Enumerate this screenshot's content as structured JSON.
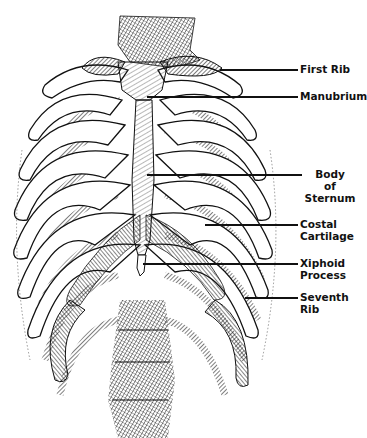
{
  "figure": {
    "labels": [
      {
        "id": "first-rib",
        "text": "First Rib",
        "lines": [
          "First Rib"
        ],
        "line_y": 70,
        "line_x1": 220,
        "line_x2": 298,
        "text_x": 300,
        "text_y": 64,
        "align": "left"
      },
      {
        "id": "manubrium",
        "text": "Manubrium",
        "lines": [
          "Manubrium"
        ],
        "line_y": 97,
        "line_x1": 147,
        "line_x2": 298,
        "text_x": 300,
        "text_y": 91,
        "align": "left"
      },
      {
        "id": "body-of-sternum",
        "text": "Body of Sternum",
        "lines": [
          "Body",
          "of",
          "Sternum"
        ],
        "line_y": 175,
        "line_x1": 147,
        "line_x2": 302,
        "text_x": 303,
        "text_y": 169,
        "align": "center"
      },
      {
        "id": "costal-cartilage",
        "text": "Costal Cartilage",
        "lines": [
          "Costal",
          "Cartilage"
        ],
        "line_y": 225,
        "line_x1": 205,
        "line_x2": 298,
        "text_x": 300,
        "text_y": 219,
        "align": "left"
      },
      {
        "id": "xiphoid-process",
        "text": "Xiphoid Process",
        "lines": [
          "Xiphoid",
          "Process"
        ],
        "line_y": 264,
        "line_x1": 143,
        "line_x2": 298,
        "text_x": 300,
        "text_y": 258,
        "align": "left"
      },
      {
        "id": "seventh-rib",
        "text": "Seventh Rib",
        "lines": [
          "Seventh",
          "Rib"
        ],
        "line_y": 298,
        "line_x1": 245,
        "line_x2": 298,
        "text_x": 300,
        "text_y": 292,
        "align": "left"
      }
    ]
  },
  "colors": {
    "ink": "#111111",
    "background": "#ffffff",
    "bone_fill": "#ffffff"
  }
}
